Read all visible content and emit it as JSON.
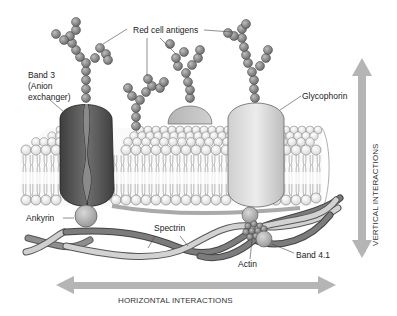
{
  "figure": {
    "colors": {
      "background": "#ffffff",
      "band3": "#5e5e5e",
      "glycophorin": "#d6d6d6",
      "antigen_bead": "#8a8a8a",
      "lipid_head": "#f4f4f4",
      "spectrin_dark": "#6e6e6e",
      "spectrin_light": "#c8c8c8",
      "arrow": "#b5b5b5",
      "text": "#222222"
    }
  },
  "labels": {
    "red_cell_antigens": "Red cell antigens",
    "band3_line1": "Band 3",
    "band3_line2": "(Anion",
    "band3_line3": "exchanger)",
    "glycophorin": "Glycophorin",
    "ankyrin": "Ankyrin",
    "spectrin": "Spectrin",
    "actin": "Actin",
    "band41": "Band 4.1",
    "vertical_interactions": "VERTICAL INTERACTIONS",
    "horizontal_interactions": "HORIZONTAL INTERACTIONS"
  },
  "components": [
    {
      "name": "Red cell antigens",
      "type": "carbohydrate chains"
    },
    {
      "name": "Band 3 (Anion exchanger)",
      "type": "transmembrane protein"
    },
    {
      "name": "Glycophorin",
      "type": "transmembrane protein"
    },
    {
      "name": "Ankyrin",
      "type": "linker protein"
    },
    {
      "name": "Spectrin",
      "type": "cytoskeletal filament"
    },
    {
      "name": "Actin",
      "type": "cytoskeletal junction"
    },
    {
      "name": "Band 4.1",
      "type": "junctional protein"
    }
  ],
  "axes": {
    "vertical": "VERTICAL INTERACTIONS",
    "horizontal": "HORIZONTAL INTERACTIONS"
  }
}
